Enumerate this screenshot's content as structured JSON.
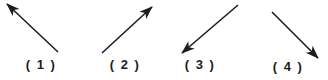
{
  "figure": {
    "background": "#ffffff",
    "line_color": "#1d1d1d",
    "arrows": [
      {
        "label": "( 1 )",
        "direction": "up-left",
        "x1": 58,
        "y1": 52,
        "x2": 7,
        "y2": 4,
        "label_cx": 41,
        "label_cy": 64
      },
      {
        "label": "( 2 )",
        "direction": "up-right",
        "x1": 102,
        "y1": 53,
        "x2": 152,
        "y2": 7,
        "label_cx": 125,
        "label_cy": 64
      },
      {
        "label": "( 3 )",
        "direction": "down-left",
        "x1": 238,
        "y1": 5,
        "x2": 182,
        "y2": 53,
        "label_cx": 200,
        "label_cy": 64
      },
      {
        "label": "( 4 )",
        "direction": "down-right",
        "x1": 272,
        "y1": 12,
        "x2": 318,
        "y2": 58,
        "label_cx": 288,
        "label_cy": 66
      }
    ]
  }
}
